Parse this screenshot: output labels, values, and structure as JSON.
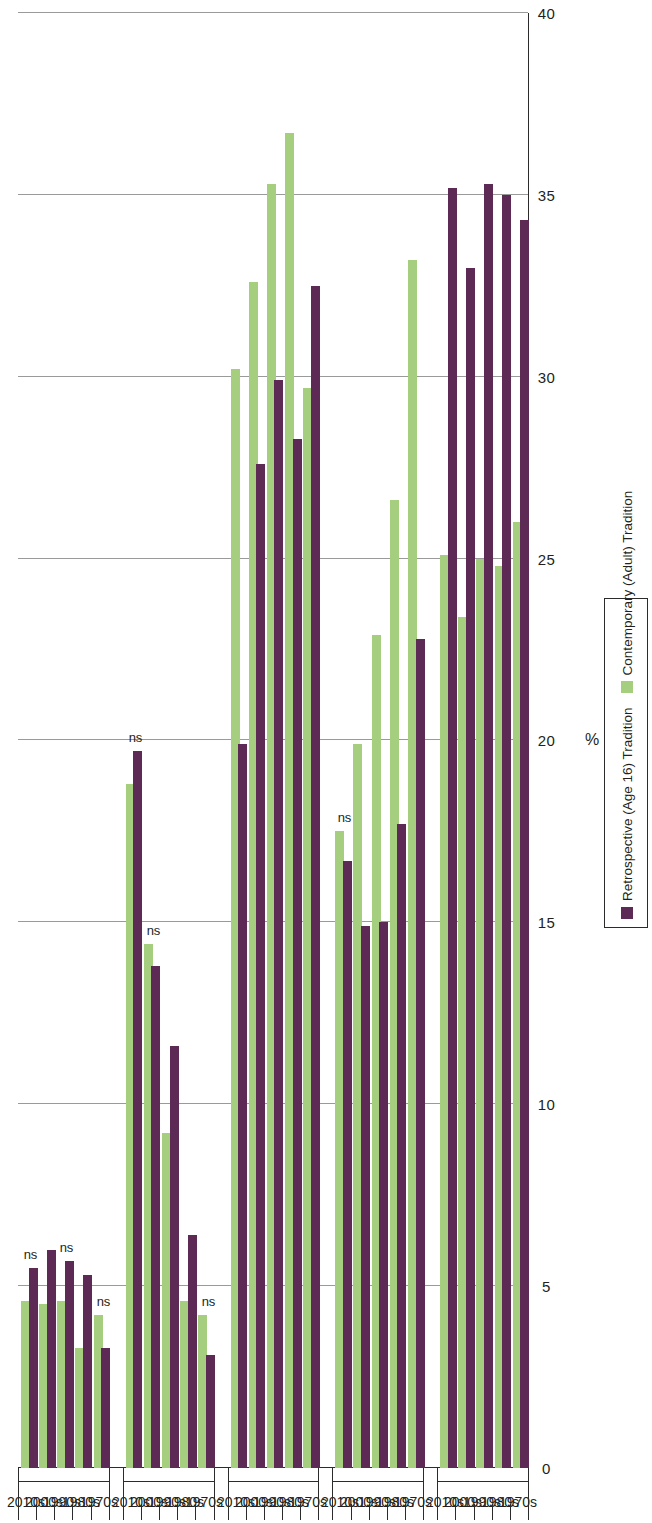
{
  "legend": {
    "items": [
      {
        "label": "Retrospective (Age 16) Tradition",
        "color": "#5c2a55",
        "key": "retro"
      },
      {
        "label": "Contemporary (Adult) Tradition",
        "color": "#a5ce7f",
        "key": "contemp"
      }
    ]
  },
  "axis": {
    "value_title": "%",
    "ticks": [
      "40",
      "35",
      "30",
      "25",
      "20",
      "15",
      "10",
      "5",
      "0"
    ],
    "tick_values": [
      40,
      35,
      30,
      25,
      20,
      15,
      10,
      5,
      0
    ],
    "min": 0,
    "max": 40
  },
  "chart_data": {
    "type": "bar",
    "title": "",
    "xlabel": "%",
    "ylabel": "",
    "ylim": [
      0,
      40
    ],
    "grid": true,
    "orientation": "horizontal",
    "legend_position": "right",
    "categories": [
      "Catholic",
      "Mainline",
      "Conservative",
      "None",
      "Other"
    ],
    "decades": [
      "1970s",
      "1980s",
      "1990s",
      "2000s",
      "2010s"
    ],
    "series": [
      {
        "name": "Retrospective (Age 16) Tradition",
        "color": "#5c2a55"
      },
      {
        "name": "Contemporary (Adult) Tradition",
        "color": "#a5ce7f"
      }
    ],
    "groups": [
      {
        "group": "Catholic",
        "rows": [
          {
            "decade": "1970s",
            "retrospective": 34.3,
            "contemporary": 26.0,
            "ns": false
          },
          {
            "decade": "1980s",
            "retrospective": 35.0,
            "contemporary": 24.8,
            "ns": false
          },
          {
            "decade": "1990s",
            "retrospective": 35.3,
            "contemporary": 25.0,
            "ns": false
          },
          {
            "decade": "2000s",
            "retrospective": 33.0,
            "contemporary": 23.4,
            "ns": false
          },
          {
            "decade": "2010s",
            "retrospective": 35.2,
            "contemporary": 25.1,
            "ns": false
          }
        ]
      },
      {
        "group": "Mainline",
        "rows": [
          {
            "decade": "1970s",
            "retrospective": 22.8,
            "contemporary": 33.2,
            "ns": false
          },
          {
            "decade": "1980s",
            "retrospective": 17.7,
            "contemporary": 26.6,
            "ns": false
          },
          {
            "decade": "1990s",
            "retrospective": 15.0,
            "contemporary": 22.9,
            "ns": false
          },
          {
            "decade": "2000s",
            "retrospective": 14.9,
            "contemporary": 19.9,
            "ns": false
          },
          {
            "decade": "2010s",
            "retrospective": 16.7,
            "contemporary": 17.5,
            "ns": true
          }
        ]
      },
      {
        "group": "Conservative",
        "rows": [
          {
            "decade": "1970s",
            "retrospective": 32.5,
            "contemporary": 29.7,
            "ns": false
          },
          {
            "decade": "1980s",
            "retrospective": 28.3,
            "contemporary": 36.7,
            "ns": false
          },
          {
            "decade": "1990s",
            "retrospective": 29.9,
            "contemporary": 35.3,
            "ns": false
          },
          {
            "decade": "2000s",
            "retrospective": 27.6,
            "contemporary": 32.6,
            "ns": false
          },
          {
            "decade": "2010s",
            "retrospective": 19.9,
            "contemporary": 30.2,
            "ns": false
          }
        ]
      },
      {
        "group": "None",
        "rows": [
          {
            "decade": "1970s",
            "retrospective": 3.1,
            "contemporary": 4.2,
            "ns": true
          },
          {
            "decade": "1980s",
            "retrospective": 6.4,
            "contemporary": 4.6,
            "ns": false
          },
          {
            "decade": "1990s",
            "retrospective": 11.6,
            "contemporary": 9.2,
            "ns": false
          },
          {
            "decade": "2000s",
            "retrospective": 13.8,
            "contemporary": 14.4,
            "ns": true
          },
          {
            "decade": "2010s",
            "retrospective": 19.7,
            "contemporary": 18.8,
            "ns": true
          }
        ]
      },
      {
        "group": "Other",
        "rows": [
          {
            "decade": "1970s",
            "retrospective": 3.3,
            "contemporary": 4.2,
            "ns": true
          },
          {
            "decade": "1980s",
            "retrospective": 5.3,
            "contemporary": 3.3,
            "ns": false
          },
          {
            "decade": "1990s",
            "retrospective": 5.7,
            "contemporary": 4.6,
            "ns": true
          },
          {
            "decade": "2000s",
            "retrospective": 6.0,
            "contemporary": 4.5,
            "ns": false
          },
          {
            "decade": "2010s",
            "retrospective": 5.5,
            "contemporary": 4.6,
            "ns": true
          }
        ]
      }
    ],
    "annotations": {
      "ns_label": "ns",
      "ns_meaning": "not significant"
    }
  }
}
